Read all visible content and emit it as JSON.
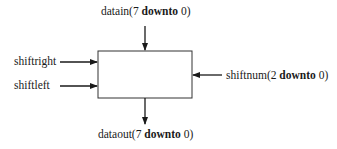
{
  "diagram": {
    "type": "block-diagram",
    "block": {
      "label": ""
    },
    "ports": {
      "datain": {
        "name": "datain",
        "open": "(7 ",
        "kw": "downto",
        "close": " 0)",
        "direction": "input",
        "side": "top"
      },
      "shiftright": {
        "name": "shiftright",
        "direction": "input",
        "side": "left"
      },
      "shiftleft": {
        "name": "shiftleft",
        "direction": "input",
        "side": "left"
      },
      "shiftnum": {
        "name": "shiftnum",
        "open": "(2 ",
        "kw": "downto",
        "close": " 0)",
        "direction": "input",
        "side": "right"
      },
      "dataout": {
        "name": "dataout",
        "open": "(7 ",
        "kw": "downto",
        "close": " 0)",
        "direction": "output",
        "side": "bottom"
      }
    },
    "colors": {
      "stroke": "#1a1a1a",
      "background": "#ffffff"
    }
  }
}
